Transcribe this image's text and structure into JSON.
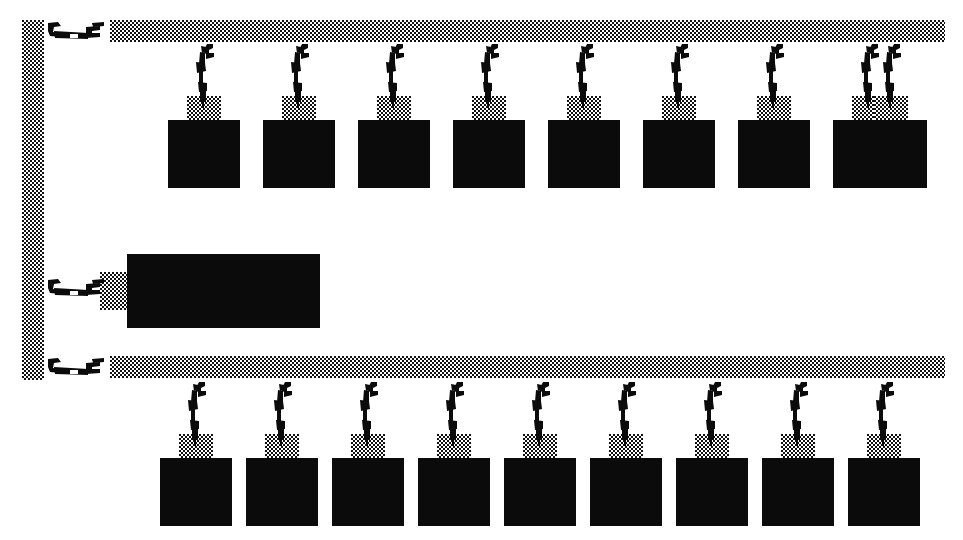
{
  "figure": {
    "background_color": "#ffffff",
    "ink_color": "#0b0b0b",
    "stipple_color": "#111111",
    "width": 963,
    "height": 540
  },
  "rails": [
    {
      "name": "vertical-left-rail",
      "orientation": "vertical",
      "x": 22,
      "y": 20,
      "width": 22,
      "height": 360
    },
    {
      "name": "upper-horizontal-rail",
      "orientation": "horizontal",
      "x": 110,
      "y": 20,
      "width": 835,
      "height": 22
    },
    {
      "name": "lower-horizontal-rail",
      "orientation": "horizontal",
      "x": 110,
      "y": 356,
      "width": 835,
      "height": 22
    }
  ],
  "side_clamps": [
    {
      "name": "clamp-upper-rail-end",
      "x": 48,
      "y": 20,
      "flip": false
    },
    {
      "name": "clamp-middle-carrier",
      "x": 48,
      "y": 277,
      "flip": false
    },
    {
      "name": "clamp-lower-rail-end",
      "x": 48,
      "y": 356,
      "flip": false
    }
  ],
  "middle_carrier": {
    "name": "middle-carrier-block",
    "x": 127,
    "y": 254,
    "width": 193,
    "height": 74,
    "pad": {
      "x": 100,
      "y": 272,
      "width": 32,
      "height": 38
    }
  },
  "upper_row": {
    "label": "upper-carrier-row",
    "count": 9,
    "hanger_y": 44,
    "pad_y": 96,
    "pad_width": 34,
    "pad_height": 24,
    "box_y": 120,
    "box_width": 72,
    "box_height": 68,
    "first_box_x": 168,
    "pitch": 94.9,
    "items": [
      {
        "name": "carrier-1",
        "box_x": 168
      },
      {
        "name": "carrier-2",
        "box_x": 263
      },
      {
        "name": "carrier-3",
        "box_x": 358
      },
      {
        "name": "carrier-4",
        "box_x": 453
      },
      {
        "name": "carrier-5",
        "box_x": 548
      },
      {
        "name": "carrier-6",
        "box_x": 643
      },
      {
        "name": "carrier-7",
        "box_x": 738
      },
      {
        "name": "carrier-8",
        "box_x": 833
      },
      {
        "name": "carrier-9",
        "box_x": 855
      }
    ]
  },
  "lower_row": {
    "label": "lower-carrier-row",
    "count": 9,
    "hanger_y": 382,
    "pad_y": 434,
    "pad_width": 34,
    "pad_height": 24,
    "box_y": 458,
    "box_width": 72,
    "box_height": 68,
    "first_box_x": 160,
    "pitch": 94.0,
    "items": [
      {
        "name": "carrier-10",
        "box_x": 160
      },
      {
        "name": "carrier-11",
        "box_x": 246
      },
      {
        "name": "carrier-12",
        "box_x": 332
      },
      {
        "name": "carrier-13",
        "box_x": 418
      },
      {
        "name": "carrier-14",
        "box_x": 504
      },
      {
        "name": "carrier-15",
        "box_x": 590
      },
      {
        "name": "carrier-16",
        "box_x": 676
      },
      {
        "name": "carrier-17",
        "box_x": 762
      },
      {
        "name": "carrier-18",
        "box_x": 848
      }
    ]
  }
}
